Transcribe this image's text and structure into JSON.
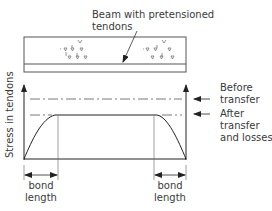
{
  "diagram": {
    "title_label": "Beam with pretensioned tendons",
    "beam_label_line1": "Beam with pretensioned",
    "beam_label_line2": "tendons",
    "y_axis_label": "Stress in tendons",
    "levels": [
      {
        "name": "before-transfer",
        "line1": "Before",
        "line2": "transfer",
        "line3": ""
      },
      {
        "name": "after-transfer",
        "line1": "After",
        "line2": "transfer",
        "line3": "and losses"
      }
    ],
    "bond_length_left": {
      "line1": "bond",
      "line2": "length"
    },
    "bond_length_right": {
      "line1": "bond",
      "line2": "length"
    },
    "colors": {
      "line": "#3a3a3a",
      "dash": "#555555",
      "text": "#3a3a3a"
    }
  }
}
